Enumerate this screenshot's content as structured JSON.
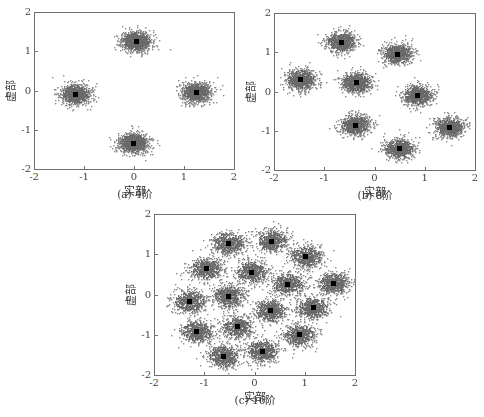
{
  "chart_data": [
    {
      "type": "scatter",
      "title": "",
      "caption": "(a) 4阶",
      "xlabel": "实部",
      "ylabel": "虚部",
      "xlim": [
        -2,
        2
      ],
      "ylim": [
        -2,
        2
      ],
      "xticks": [
        "-2",
        "-1",
        "0",
        "1",
        "2"
      ],
      "yticks": [
        "-2",
        "-1",
        "0",
        "1",
        "2"
      ],
      "grid": false,
      "cloud_spread": 0.13,
      "points_per_cluster": 900,
      "seed": 11,
      "constellation": [
        {
          "x": 0.0,
          "y": 1.3
        },
        {
          "x": -1.2,
          "y": -0.05
        },
        {
          "x": 1.2,
          "y": 0.0
        },
        {
          "x": -0.05,
          "y": -1.28
        }
      ]
    },
    {
      "type": "scatter",
      "title": "",
      "caption": "(b) 8阶",
      "xlabel": "实部",
      "ylabel": "虚部",
      "xlim": [
        -2,
        2
      ],
      "ylim": [
        -2,
        2
      ],
      "xticks": [
        "-2",
        "-1",
        "0",
        "1",
        "2"
      ],
      "yticks": [
        "-2",
        "-1",
        "0",
        "1",
        "2"
      ],
      "grid": false,
      "cloud_spread": 0.13,
      "points_per_cluster": 700,
      "seed": 23,
      "constellation": [
        {
          "x": -0.7,
          "y": 1.3
        },
        {
          "x": 0.42,
          "y": 1.0
        },
        {
          "x": -1.5,
          "y": 0.35
        },
        {
          "x": -0.4,
          "y": 0.27
        },
        {
          "x": 0.82,
          "y": -0.05
        },
        {
          "x": -0.42,
          "y": -0.8
        },
        {
          "x": 1.45,
          "y": -0.85
        },
        {
          "x": 0.45,
          "y": -1.4
        }
      ]
    },
    {
      "type": "scatter",
      "title": "",
      "caption": "(c) 16阶",
      "xlabel": "实部",
      "ylabel": "虚部",
      "xlim": [
        -2,
        2
      ],
      "ylim": [
        -2,
        2
      ],
      "xticks": [
        "-2",
        "-1",
        "0",
        "1",
        "2"
      ],
      "yticks": [
        "-2",
        "-1",
        "0",
        "1",
        "2"
      ],
      "grid": false,
      "cloud_spread": 0.14,
      "points_per_cluster": 550,
      "seed": 37,
      "constellation": [
        {
          "x": -0.55,
          "y": 1.32
        },
        {
          "x": 0.3,
          "y": 1.37
        },
        {
          "x": 0.98,
          "y": 0.98
        },
        {
          "x": -1.0,
          "y": 0.68
        },
        {
          "x": -0.1,
          "y": 0.6
        },
        {
          "x": 0.62,
          "y": 0.3
        },
        {
          "x": 1.52,
          "y": 0.33
        },
        {
          "x": -1.32,
          "y": -0.12
        },
        {
          "x": -0.55,
          "y": 0.0
        },
        {
          "x": 0.28,
          "y": -0.35
        },
        {
          "x": 1.12,
          "y": -0.28
        },
        {
          "x": -1.18,
          "y": -0.87
        },
        {
          "x": -0.38,
          "y": -0.75
        },
        {
          "x": 0.85,
          "y": -0.95
        },
        {
          "x": -0.65,
          "y": -1.48
        },
        {
          "x": 0.12,
          "y": -1.35
        }
      ]
    }
  ],
  "colors": {
    "cloud": "#6a6a6a",
    "cloud_sparse": "#8a8a8a",
    "marker": "#000000",
    "axis": "#6f6f6f"
  }
}
